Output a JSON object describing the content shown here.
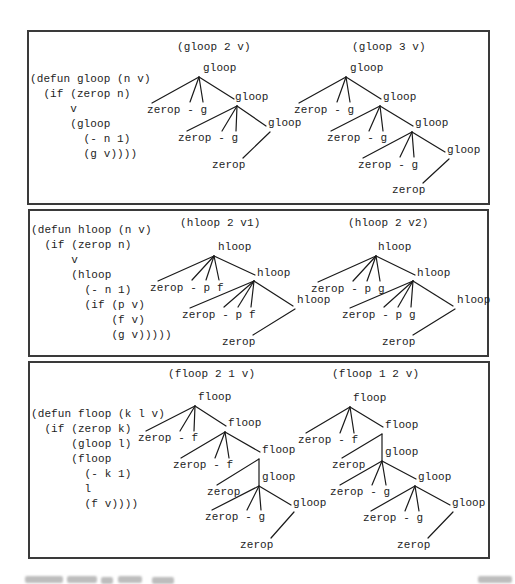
{
  "figure": {
    "ink_color": "#1d1d1d",
    "border_color": "#3a3a3a",
    "panels": [
      {
        "name": "gloop",
        "code": "(defun gloop (n v)\n  (if (zerop n)\n      v\n      (gloop\n        (- n 1)\n        (g v))))",
        "trees": [
          {
            "title": "(gloop 2 v)",
            "labels": [
              "gloop",
              "gloop",
              "gloop",
              "zerop - g",
              "zerop - g",
              "zerop"
            ]
          },
          {
            "title": "(gloop 3 v)",
            "labels": [
              "gloop",
              "gloop",
              "gloop",
              "gloop",
              "zerop - g",
              "zerop - g",
              "zerop - g",
              "zerop"
            ]
          }
        ]
      },
      {
        "name": "hloop",
        "code": "(defun hloop (n v)\n  (if (zerop n)\n      v\n      (hloop\n        (- n 1)\n        (if (p v)\n            (f v)\n            (g v)))))",
        "trees": [
          {
            "title": "(hloop 2 v1)",
            "labels": [
              "hloop",
              "hloop",
              "hloop",
              "zerop - p f",
              "zerop - p f",
              "zerop"
            ]
          },
          {
            "title": "(hloop 2 v2)",
            "labels": [
              "hloop",
              "hloop",
              "hloop",
              "zerop - p g",
              "zerop - p g",
              "zerop"
            ]
          }
        ]
      },
      {
        "name": "floop",
        "code": "(defun floop (k l v)\n  (if (zerop k)\n      (gloop l)\n      (floop\n        (- k 1)\n        l\n        (f v))))",
        "trees": [
          {
            "title": "(floop 2 1 v)",
            "labels": [
              "floop",
              "floop",
              "floop",
              "gloop",
              "gloop",
              "zerop - f",
              "zerop - f",
              "zerop",
              "zerop - g",
              "zerop"
            ]
          },
          {
            "title": "(floop 1 2 v)",
            "labels": [
              "floop",
              "floop",
              "gloop",
              "gloop",
              "gloop",
              "zerop - f",
              "zerop",
              "zerop - g",
              "zerop - g",
              "zerop"
            ]
          }
        ]
      }
    ]
  }
}
